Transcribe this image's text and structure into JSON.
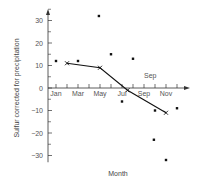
{
  "chart_data": {
    "type": "scatter",
    "title": "",
    "xlabel": "Month",
    "ylabel": "Sulfur corrected for precipitation",
    "x_tick_labels": [
      "Jan",
      "Mar",
      "May",
      "Jul",
      "Sep",
      "Nov"
    ],
    "x_tick_label_positions": [
      1,
      3,
      5,
      7,
      9,
      11
    ],
    "x_minor_ticks": [
      1,
      2,
      3,
      4,
      5,
      6,
      7,
      8,
      9,
      10,
      11,
      12
    ],
    "y_ticks": [
      30,
      20,
      10,
      0,
      -10,
      -20,
      -30
    ],
    "y_tick_labels": [
      "30",
      "20",
      "10",
      "0",
      "−10",
      "−20",
      "−30"
    ],
    "ylim": [
      -33,
      36
    ],
    "xlim": [
      0,
      13
    ],
    "grid": false,
    "annotations": [
      {
        "text": "Sep",
        "x": 9.0,
        "y": 4.5
      }
    ],
    "series": [
      {
        "name": "monthly observations",
        "style": "points",
        "points": [
          {
            "x": 1,
            "y": 12
          },
          {
            "x": 3,
            "y": 12
          },
          {
            "x": 4.9,
            "y": 32
          },
          {
            "x": 6,
            "y": 15
          },
          {
            "x": 7,
            "y": -6
          },
          {
            "x": 8,
            "y": 13
          },
          {
            "x": 9.9,
            "y": -23
          },
          {
            "x": 10,
            "y": -10
          },
          {
            "x": 11,
            "y": -32
          },
          {
            "x": 12,
            "y": -9
          }
        ]
      },
      {
        "name": "smoothed trend",
        "style": "line-x-markers",
        "points": [
          {
            "x": 2,
            "y": 11
          },
          {
            "x": 5,
            "y": 9
          },
          {
            "x": 7.5,
            "y": -1
          },
          {
            "x": 11,
            "y": -11
          }
        ]
      }
    ]
  }
}
